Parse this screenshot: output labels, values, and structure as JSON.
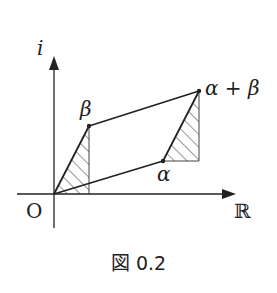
{
  "figure": {
    "caption": "図 0.2",
    "axes": {
      "y_label": "i",
      "x_label": "ℝ",
      "origin_label": "O"
    },
    "points": {
      "alpha": "α",
      "beta": "β",
      "alpha_plus_beta": "α + β"
    },
    "colors": {
      "line": "#222222",
      "background": "#ffffff"
    }
  }
}
